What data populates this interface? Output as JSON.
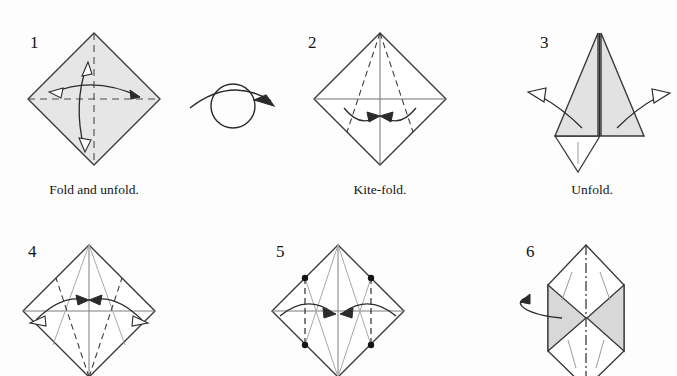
{
  "document": {
    "kind": "origami-instruction-diagram",
    "background_color": "#fdfdfd",
    "paper_shade_color": "#e4e4e4",
    "line_color": "#333333",
    "crease_color": "#8a8a8a"
  },
  "steps": [
    {
      "number": "1",
      "caption": "Fold and unfold.",
      "shape": "square-diamond",
      "shaded": true,
      "creases": "horizontal and vertical dashed diagonals",
      "arrows": "two double-headed fold-and-unfold arrows"
    },
    {
      "number": "2",
      "caption": "Kite-fold.",
      "shape": "square-diamond",
      "shaded": false,
      "creases": "two dashed kite lines from top apex",
      "arrows": "two inward curved arrows"
    },
    {
      "number": "3",
      "caption": "Unfold.",
      "shape": "kite-folded-point",
      "shaded": true,
      "creases": "center vertical line",
      "arrows": "two outward hollow unfold arrows"
    },
    {
      "number": "4",
      "caption": "",
      "shape": "square-diamond",
      "shaded": false,
      "creases": "kite creases plus dashed lower folds",
      "arrows": "two double-headed horizontal arrows"
    },
    {
      "number": "5",
      "caption": "",
      "shape": "square-diamond",
      "shaded": false,
      "creases": "vertical dashed lines with four reference dots",
      "arrows": "two inward curved arrows"
    },
    {
      "number": "6",
      "caption": "",
      "shape": "hexagon-with-flaps",
      "shaded": true,
      "creases": "dash-dot vertical center line",
      "arrows": "turn-and-roll arrow at left"
    }
  ],
  "symbols": {
    "turn_over": "turn-over-circle-arrow"
  }
}
